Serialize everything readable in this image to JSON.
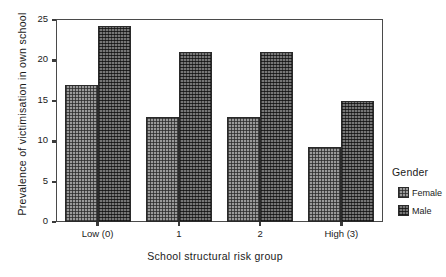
{
  "chart_data": {
    "type": "bar",
    "title": "",
    "xlabel": "School structural risk group",
    "ylabel": "Prevalence of victimisation in own school",
    "categories": [
      "Low (0)",
      "1",
      "2",
      "High (3)"
    ],
    "series": [
      {
        "name": "Female",
        "values": [
          17.0,
          13.0,
          13.0,
          9.3
        ],
        "color": "#9a9a9a"
      },
      {
        "name": "Male",
        "values": [
          24.3,
          21.1,
          21.1,
          15.0
        ],
        "color": "#4e4e4e"
      }
    ],
    "ylim": [
      0,
      25
    ],
    "yticks": [
      0,
      5,
      10,
      15,
      20,
      25
    ],
    "yticklabels": [
      "0",
      "5",
      "10",
      "15",
      "20",
      "25"
    ],
    "grid": false,
    "legend": {
      "title": "Gender",
      "position": "right",
      "entries": [
        "Female",
        "Male"
      ]
    }
  },
  "legend": {
    "title": "Gender",
    "items": [
      {
        "label": "Female",
        "swatch": "female-swatch-icon"
      },
      {
        "label": "Male",
        "swatch": "male-swatch-icon"
      }
    ]
  }
}
